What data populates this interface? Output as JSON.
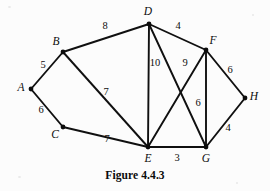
{
  "figure": {
    "caption": "Figure 4.4.3",
    "background_color": "#fcfcfc",
    "ink_color": "#0c0c0c",
    "width": 270,
    "height": 191
  },
  "graph": {
    "type": "weighted-undirected-graph",
    "vertices": [
      {
        "id": "A",
        "label": "A",
        "x": 31,
        "y": 89,
        "label_x": 21,
        "label_y": 88
      },
      {
        "id": "B",
        "label": "B",
        "x": 63,
        "y": 52,
        "label_x": 56,
        "label_y": 42
      },
      {
        "id": "C",
        "label": "C",
        "x": 63,
        "y": 127,
        "label_x": 55,
        "label_y": 135
      },
      {
        "id": "D",
        "label": "D",
        "x": 149,
        "y": 24,
        "label_x": 148,
        "label_y": 12
      },
      {
        "id": "E",
        "label": "E",
        "x": 148,
        "y": 147,
        "label_x": 148,
        "label_y": 159
      },
      {
        "id": "F",
        "label": "F",
        "x": 206,
        "y": 50,
        "label_x": 213,
        "label_y": 41
      },
      {
        "id": "G",
        "label": "G",
        "x": 206,
        "y": 147,
        "label_x": 206,
        "label_y": 159
      },
      {
        "id": "H",
        "label": "H",
        "x": 245,
        "y": 98,
        "label_x": 254,
        "label_y": 97
      }
    ],
    "edges": [
      {
        "from": "A",
        "to": "B",
        "weight": "5",
        "label_x": 43,
        "label_y": 65
      },
      {
        "from": "A",
        "to": "C",
        "weight": "6",
        "label_x": 41,
        "label_y": 110
      },
      {
        "from": "B",
        "to": "D",
        "weight": "8",
        "label_x": 105,
        "label_y": 26
      },
      {
        "from": "B",
        "to": "E",
        "weight": "7",
        "label_x": 106,
        "label_y": 92
      },
      {
        "from": "C",
        "to": "E",
        "weight": "7",
        "label_x": 107,
        "label_y": 139
      },
      {
        "from": "D",
        "to": "F",
        "weight": "4",
        "label_x": 178,
        "label_y": 26
      },
      {
        "from": "D",
        "to": "E",
        "weight": "10",
        "label_x": 155,
        "label_y": 63
      },
      {
        "from": "D",
        "to": "G",
        "weight": "",
        "label_x": 0,
        "label_y": 0
      },
      {
        "from": "F",
        "to": "E",
        "weight": "9",
        "label_x": 185,
        "label_y": 63
      },
      {
        "from": "F",
        "to": "G",
        "weight": "6",
        "label_x": 198,
        "label_y": 103
      },
      {
        "from": "F",
        "to": "H",
        "weight": "6",
        "label_x": 230,
        "label_y": 70
      },
      {
        "from": "G",
        "to": "H",
        "weight": "4",
        "label_x": 228,
        "label_y": 128
      },
      {
        "from": "E",
        "to": "G",
        "weight": "3",
        "label_x": 177,
        "label_y": 158
      }
    ]
  }
}
